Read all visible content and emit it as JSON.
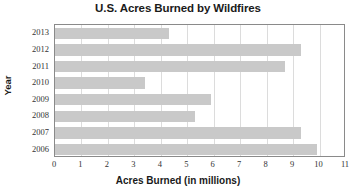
{
  "chart_data": {
    "type": "bar",
    "orientation": "horizontal",
    "title": "U.S. Acres Burned by Wildfires",
    "xlabel": "Acres Burned (in millions)",
    "ylabel": "Year",
    "categories": [
      "2013",
      "2012",
      "2011",
      "2010",
      "2009",
      "2008",
      "2007",
      "2006"
    ],
    "values": [
      4.3,
      9.3,
      8.7,
      3.4,
      5.9,
      5.3,
      9.3,
      9.9
    ],
    "xlim": [
      0,
      11
    ],
    "xticks": [
      "0",
      "1",
      "2",
      "3",
      "4",
      "5",
      "6",
      "7",
      "8",
      "9",
      "10",
      "11"
    ],
    "xtick_values": [
      0,
      1,
      2,
      3,
      4,
      5,
      6,
      7,
      8,
      9,
      10,
      11
    ],
    "grid": "vertical",
    "legend": "none",
    "bar_color": "#c9c9c9",
    "gridline_color": "#dcdcdc",
    "axis_color": "#8a8a8a",
    "background_color": "#ffffff"
  }
}
